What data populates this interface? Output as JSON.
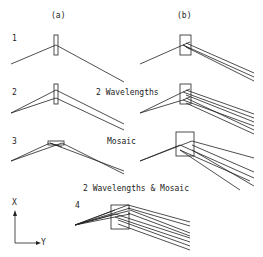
{
  "figure": {
    "column_labels": {
      "a": "(a)",
      "b": "(b)"
    },
    "rows": [
      {
        "number": "1",
        "caption": ""
      },
      {
        "number": "2",
        "caption": "2 Wavelengths"
      },
      {
        "number": "3",
        "caption": "Mosaic"
      },
      {
        "number": "4",
        "caption": "2 Wavelengths & Mosaic"
      }
    ],
    "axes": {
      "x_label": "X",
      "y_label": "Y"
    },
    "colors": {
      "line": "#222222",
      "background": "#ffffff"
    }
  }
}
